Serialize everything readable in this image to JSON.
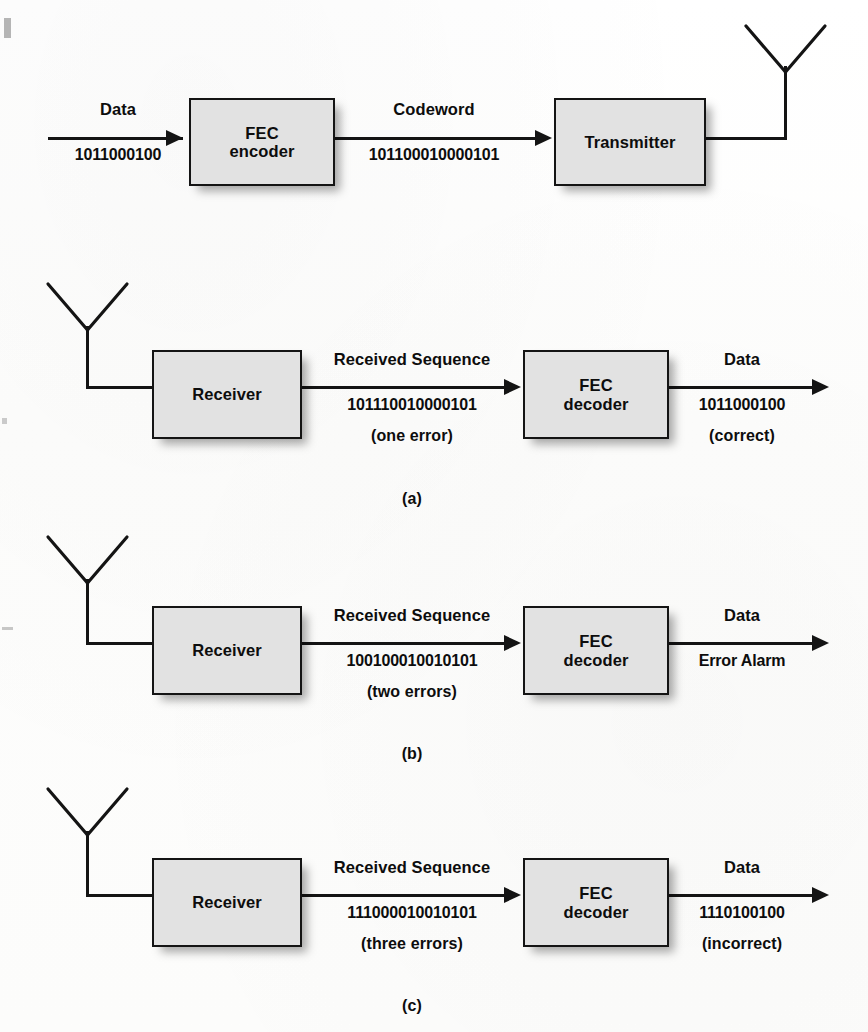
{
  "figure": {
    "kind": "fec-block-diagram",
    "background_color": "#fefefe",
    "block_fill_color": "#e2e2e2",
    "line_color": "#141414"
  },
  "transmit_chain": {
    "input_label": "Data",
    "input_bits": "1011000100",
    "encoder_block": {
      "line1": "FEC",
      "line2": "encoder"
    },
    "middle_label": "Codeword",
    "middle_bits": "101100010000101",
    "transmitter_block": {
      "line1": "Transmitter"
    },
    "antenna_icon": "transmit-antenna-icon"
  },
  "panels": [
    {
      "id": "a",
      "caption": "(a)",
      "antenna_icon": "receive-antenna-icon",
      "receiver_block": {
        "line1": "Receiver"
      },
      "middle_label": "Received Sequence",
      "middle_bits": "101110010000101",
      "middle_note": "(one error)",
      "decoder_block": {
        "line1": "FEC",
        "line2": "decoder"
      },
      "output_label": "Data",
      "output_bits": "1011000100",
      "output_note": "(correct)"
    },
    {
      "id": "b",
      "caption": "(b)",
      "antenna_icon": "receive-antenna-icon",
      "receiver_block": {
        "line1": "Receiver"
      },
      "middle_label": "Received Sequence",
      "middle_bits": "100100010010101",
      "middle_note": "(two errors)",
      "decoder_block": {
        "line1": "FEC",
        "line2": "decoder"
      },
      "output_label": "Data",
      "output_bits": "Error Alarm",
      "output_note": ""
    },
    {
      "id": "c",
      "caption": "(c)",
      "antenna_icon": "receive-antenna-icon",
      "receiver_block": {
        "line1": "Receiver"
      },
      "middle_label": "Received Sequence",
      "middle_bits": "111000010010101",
      "middle_note": "(three errors)",
      "decoder_block": {
        "line1": "FEC",
        "line2": "decoder"
      },
      "output_label": "Data",
      "output_bits": "1110100100",
      "output_note": "(incorrect)"
    }
  ]
}
